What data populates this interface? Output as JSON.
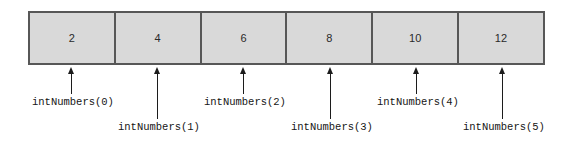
{
  "figure": {
    "colors": {
      "cell_fill": "#d9d9d9",
      "cell_border": "#575757",
      "arrow": "#1c1c1c",
      "label_text": "#151515",
      "value_text": "#2a2a2a",
      "background": "#ffffff"
    }
  },
  "array": {
    "name": "intNumbers",
    "length": 6,
    "cells": [
      {
        "index": 0,
        "value": "2",
        "label": "intNumbers(0)",
        "center_x": 71,
        "label_row": "upper"
      },
      {
        "index": 1,
        "value": "4",
        "label": "intNumbers(1)",
        "center_x": 157,
        "label_row": "lower"
      },
      {
        "index": 2,
        "value": "6",
        "label": "intNumbers(2)",
        "center_x": 243,
        "label_row": "upper"
      },
      {
        "index": 3,
        "value": "8",
        "label": "intNumbers(3)",
        "center_x": 330,
        "label_row": "lower"
      },
      {
        "index": 4,
        "value": "10",
        "label": "intNumbers(4)",
        "center_x": 416,
        "label_row": "upper"
      },
      {
        "index": 5,
        "value": "12",
        "label": "intNumbers(5)",
        "center_x": 502,
        "label_row": "lower"
      }
    ]
  }
}
